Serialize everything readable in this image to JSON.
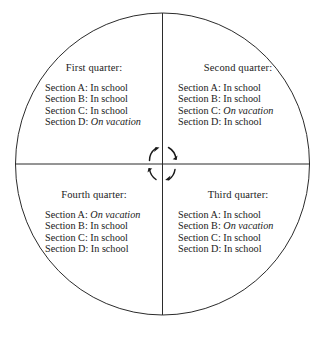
{
  "figure": {
    "name": "rotating-four-quarter-school-calendar-diagram",
    "shape": "circle-divided-into-four-quadrants",
    "rotation_indicator": "clockwise-circular-arrows",
    "line_color": "#2b2b2b",
    "background_color": "#ffffff"
  },
  "quadrants": [
    {
      "id": "first-quarter",
      "title": "First quarter:",
      "sections": [
        {
          "label": "Section A:",
          "status": "In school",
          "italic": false
        },
        {
          "label": "Section B:",
          "status": "In school",
          "italic": false
        },
        {
          "label": "Section C:",
          "status": "In school",
          "italic": false
        },
        {
          "label": "Section D:",
          "status": "On vacation",
          "italic": true
        }
      ]
    },
    {
      "id": "second-quarter",
      "title": "Second quarter:",
      "sections": [
        {
          "label": "Section A:",
          "status": "In school",
          "italic": false
        },
        {
          "label": "Section B:",
          "status": "In school",
          "italic": false
        },
        {
          "label": "Section C:",
          "status": "On vacation",
          "italic": true
        },
        {
          "label": "Section D:",
          "status": "In school",
          "italic": false
        }
      ]
    },
    {
      "id": "third-quarter",
      "title": "Third quarter:",
      "sections": [
        {
          "label": "Section A:",
          "status": "In school",
          "italic": false
        },
        {
          "label": "Section B:",
          "status": "On vacation",
          "italic": true
        },
        {
          "label": "Section C:",
          "status": "In school",
          "italic": false
        },
        {
          "label": "Section D:",
          "status": "In school",
          "italic": false
        }
      ]
    },
    {
      "id": "fourth-quarter",
      "title": "Fourth quarter:",
      "sections": [
        {
          "label": "Section A:",
          "status": "On vacation",
          "italic": true
        },
        {
          "label": "Section B:",
          "status": "In school",
          "italic": false
        },
        {
          "label": "Section C:",
          "status": "In school",
          "italic": false
        },
        {
          "label": "Section D:",
          "status": "In school",
          "italic": false
        }
      ]
    }
  ]
}
